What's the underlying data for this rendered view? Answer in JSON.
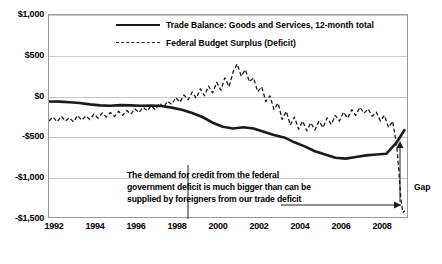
{
  "chart_data": {
    "type": "line",
    "title": "",
    "axis_note": "Billions of $",
    "xlabel": "",
    "ylabel": "",
    "ylim": [
      -1500,
      1000
    ],
    "yticks": [
      1000,
      500,
      0,
      -500,
      -1000,
      -1500
    ],
    "ytick_labels": [
      "$1,000",
      "$500",
      "$0",
      "-$500",
      "-$1,000",
      "-$1,500"
    ],
    "xlim": [
      1992,
      2009.6
    ],
    "xticks": [
      1992,
      1994,
      1996,
      1998,
      2000,
      2002,
      2004,
      2006,
      2008
    ],
    "xtick_labels": [
      "1992",
      "1994",
      "1996",
      "1998",
      "2000",
      "2002",
      "2004",
      "2006",
      "2008"
    ],
    "grid": true,
    "legend_position": "top-center",
    "series": [
      {
        "name": "Trade Balance:  Goods and Services, 12-month total",
        "style": "solid",
        "color": "#1a1a1a",
        "points": [
          [
            1992.0,
            -60
          ],
          [
            1992.5,
            -62
          ],
          [
            1993.0,
            -70
          ],
          [
            1993.5,
            -78
          ],
          [
            1994.0,
            -95
          ],
          [
            1994.5,
            -108
          ],
          [
            1995.0,
            -112
          ],
          [
            1995.5,
            -105
          ],
          [
            1996.0,
            -108
          ],
          [
            1996.5,
            -112
          ],
          [
            1997.0,
            -110
          ],
          [
            1997.5,
            -115
          ],
          [
            1998.0,
            -135
          ],
          [
            1998.5,
            -160
          ],
          [
            1999.0,
            -200
          ],
          [
            1999.5,
            -250
          ],
          [
            2000.0,
            -320
          ],
          [
            2000.5,
            -370
          ],
          [
            2001.0,
            -390
          ],
          [
            2001.5,
            -375
          ],
          [
            2002.0,
            -390
          ],
          [
            2002.5,
            -430
          ],
          [
            2003.0,
            -470
          ],
          [
            2003.5,
            -500
          ],
          [
            2004.0,
            -560
          ],
          [
            2004.5,
            -610
          ],
          [
            2005.0,
            -670
          ],
          [
            2005.5,
            -710
          ],
          [
            2006.0,
            -750
          ],
          [
            2006.5,
            -760
          ],
          [
            2007.0,
            -740
          ],
          [
            2007.5,
            -720
          ],
          [
            2008.0,
            -710
          ],
          [
            2008.5,
            -700
          ],
          [
            2009.0,
            -560
          ],
          [
            2009.4,
            -400
          ]
        ]
      },
      {
        "name": "Federal Budget Surplus (Deficit)",
        "style": "dashed",
        "color": "#1a1a1a",
        "points": [
          [
            1992.0,
            -300
          ],
          [
            1992.2,
            -250
          ],
          [
            1992.4,
            -310
          ],
          [
            1992.6,
            -240
          ],
          [
            1992.8,
            -300
          ],
          [
            1993.0,
            -260
          ],
          [
            1993.2,
            -310
          ],
          [
            1993.4,
            -230
          ],
          [
            1993.6,
            -290
          ],
          [
            1993.8,
            -235
          ],
          [
            1994.0,
            -280
          ],
          [
            1994.2,
            -215
          ],
          [
            1994.4,
            -265
          ],
          [
            1994.6,
            -200
          ],
          [
            1994.8,
            -250
          ],
          [
            1995.0,
            -195
          ],
          [
            1995.2,
            -245
          ],
          [
            1995.4,
            -180
          ],
          [
            1995.6,
            -230
          ],
          [
            1995.8,
            -170
          ],
          [
            1996.0,
            -215
          ],
          [
            1996.2,
            -150
          ],
          [
            1996.4,
            -195
          ],
          [
            1996.6,
            -130
          ],
          [
            1996.8,
            -175
          ],
          [
            1997.0,
            -110
          ],
          [
            1997.2,
            -160
          ],
          [
            1997.4,
            -80
          ],
          [
            1997.6,
            -130
          ],
          [
            1997.8,
            -55
          ],
          [
            1998.0,
            -95
          ],
          [
            1998.2,
            -10
          ],
          [
            1998.4,
            -70
          ],
          [
            1998.6,
            20
          ],
          [
            1998.8,
            -40
          ],
          [
            1999.0,
            55
          ],
          [
            1999.2,
            -20
          ],
          [
            1999.4,
            95
          ],
          [
            1999.6,
            10
          ],
          [
            1999.8,
            130
          ],
          [
            2000.0,
            45
          ],
          [
            2000.2,
            175
          ],
          [
            2000.4,
            80
          ],
          [
            2000.6,
            230
          ],
          [
            2000.8,
            120
          ],
          [
            2001.0,
            300
          ],
          [
            2001.2,
            400
          ],
          [
            2001.4,
            250
          ],
          [
            2001.6,
            330
          ],
          [
            2001.8,
            180
          ],
          [
            2002.0,
            230
          ],
          [
            2002.2,
            60
          ],
          [
            2002.4,
            120
          ],
          [
            2002.6,
            -60
          ],
          [
            2002.8,
            10
          ],
          [
            2003.0,
            -160
          ],
          [
            2003.2,
            -80
          ],
          [
            2003.4,
            -280
          ],
          [
            2003.6,
            -180
          ],
          [
            2003.8,
            -350
          ],
          [
            2004.0,
            -250
          ],
          [
            2004.2,
            -400
          ],
          [
            2004.4,
            -300
          ],
          [
            2004.6,
            -420
          ],
          [
            2004.8,
            -320
          ],
          [
            2005.0,
            -410
          ],
          [
            2005.2,
            -300
          ],
          [
            2005.4,
            -380
          ],
          [
            2005.6,
            -260
          ],
          [
            2005.8,
            -340
          ],
          [
            2006.0,
            -230
          ],
          [
            2006.2,
            -300
          ],
          [
            2006.4,
            -190
          ],
          [
            2006.6,
            -265
          ],
          [
            2006.8,
            -160
          ],
          [
            2007.0,
            -230
          ],
          [
            2007.2,
            -130
          ],
          [
            2007.4,
            -205
          ],
          [
            2007.6,
            -150
          ],
          [
            2007.8,
            -240
          ],
          [
            2008.0,
            -190
          ],
          [
            2008.2,
            -300
          ],
          [
            2008.4,
            -230
          ],
          [
            2008.6,
            -380
          ],
          [
            2008.8,
            -300
          ],
          [
            2009.0,
            -600
          ],
          [
            2009.1,
            -900
          ],
          [
            2009.2,
            -1250
          ],
          [
            2009.3,
            -1420
          ],
          [
            2009.4,
            -1400
          ]
        ]
      }
    ],
    "annotation": {
      "text": "The demand for credit from the federal government deficit is much bigger than can be supplied by foreigners from our trade deficit",
      "line1": "The demand for credit from the federal",
      "line2": "government deficit is much bigger than can be",
      "line3": "supplied by foreigners from our trade deficit"
    },
    "gap_label": "Gap"
  }
}
